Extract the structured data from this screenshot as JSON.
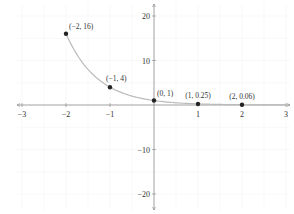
{
  "chart_data": {
    "type": "line",
    "title": "",
    "xlabel": "",
    "ylabel": "",
    "xlim": [
      -3,
      3
    ],
    "ylim": [
      -20,
      20
    ],
    "grid": true,
    "x_ticks": [
      -3,
      -2,
      -1,
      1,
      2,
      3
    ],
    "x_tick_labels": [
      "−3",
      "−2",
      "−1",
      "1",
      "2",
      "3"
    ],
    "y_ticks": [
      20,
      10,
      -10,
      -20
    ],
    "y_tick_labels": [
      "20",
      "10",
      "−10",
      "−20"
    ],
    "series": [
      {
        "name": "y = (1/4)^x",
        "curve": "exponential",
        "color": "#bbbbbb",
        "x_range": [
          -2,
          3
        ]
      }
    ],
    "points": [
      {
        "x": -2,
        "y": 16,
        "label": "(−2, 16)"
      },
      {
        "x": -1,
        "y": 4,
        "label": "(−1, 4)"
      },
      {
        "x": 0,
        "y": 1,
        "label": "(0, 1)"
      },
      {
        "x": 1,
        "y": 0.25,
        "label": "(1, 0.25)"
      },
      {
        "x": 2,
        "y": 0.06,
        "label": "(2, 0.06)"
      }
    ],
    "colors": {
      "axis": "#666666",
      "grid": "#f0f0f0",
      "curve": "#bbbbbb",
      "point": "#222222"
    }
  }
}
